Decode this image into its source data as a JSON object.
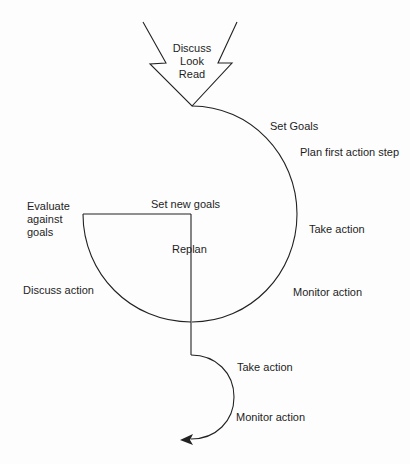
{
  "diagram": {
    "stroke_color": "#222222",
    "background": "#fdfdfd",
    "input_arrow": {
      "lines": [
        "Discuss",
        "Look",
        "Read"
      ]
    },
    "outer_cycle": {
      "labels": {
        "set_goals": "Set Goals",
        "plan_first": "Plan first action step",
        "take_action": "Take action",
        "monitor_action": "Monitor action"
      }
    },
    "inner_cycle": {
      "labels": {
        "evaluate": [
          "Evaluate",
          "against",
          "goals"
        ],
        "discuss_action": "Discuss action",
        "set_new_goals": "Set new goals",
        "replan": "Replan"
      }
    },
    "final_cycle": {
      "labels": {
        "take_action": "Take action",
        "monitor_action": "Monitor action"
      }
    }
  }
}
